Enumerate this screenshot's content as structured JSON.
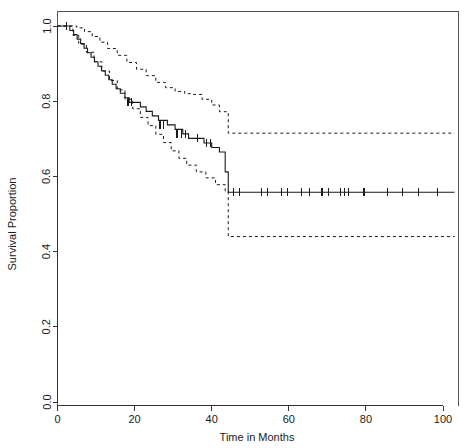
{
  "chart_data": {
    "type": "line",
    "title": "",
    "xlabel": "Time in Months",
    "ylabel": "Survival Proportion",
    "xlim": [
      0,
      103
    ],
    "ylim": [
      0.0,
      1.0
    ],
    "grid": false,
    "legend": null,
    "xticks": [
      0,
      20,
      40,
      60,
      80,
      100
    ],
    "xticklabels": [
      "0",
      "20",
      "40",
      "60",
      "80",
      "100"
    ],
    "yticks": [
      0.0,
      0.2,
      0.4,
      0.6,
      0.8,
      1.0
    ],
    "yticklabels": [
      "0.0",
      "0.2",
      "0.4",
      "0.6",
      "0.8",
      "1.0"
    ],
    "series": [
      {
        "name": "Kaplan-Meier estimate",
        "style": "solid-step",
        "x": [
          0,
          2.4,
          3.2,
          4.2,
          5.1,
          6.0,
          6.9,
          7.8,
          8.7,
          9.6,
          10.5,
          11.4,
          12.4,
          13.3,
          14.2,
          15.2,
          16.3,
          17.5,
          18.6,
          20.0,
          21.5,
          23.0,
          24.6,
          26.2,
          28.5,
          30.5,
          32.5,
          34.0,
          36.0,
          38.0,
          40.0,
          42.0,
          43.5,
          44.3,
          103
        ],
        "y": [
          1.0,
          1.0,
          0.988,
          0.977,
          0.965,
          0.953,
          0.941,
          0.929,
          0.917,
          0.905,
          0.893,
          0.881,
          0.869,
          0.857,
          0.845,
          0.833,
          0.821,
          0.809,
          0.797,
          0.797,
          0.785,
          0.773,
          0.761,
          0.749,
          0.737,
          0.725,
          0.713,
          0.701,
          0.701,
          0.689,
          0.677,
          0.665,
          0.612,
          0.558,
          0.558
        ]
      },
      {
        "name": "Upper 95% confidence limit",
        "style": "dashed-step",
        "x": [
          0,
          3.0,
          5.0,
          7.0,
          9.0,
          11.0,
          13.0,
          15.5,
          18.0,
          20.5,
          23.0,
          25.5,
          28.0,
          30.5,
          33.0,
          35.0,
          37.5,
          40.0,
          42.0,
          44.3,
          103
        ],
        "y": [
          1.0,
          1.0,
          0.995,
          0.985,
          0.972,
          0.957,
          0.94,
          0.922,
          0.903,
          0.885,
          0.868,
          0.85,
          0.836,
          0.826,
          0.82,
          0.818,
          0.805,
          0.79,
          0.772,
          0.715,
          0.715
        ]
      },
      {
        "name": "Lower 95% confidence limit",
        "style": "dashed-step",
        "x": [
          0,
          2.5,
          4.0,
          5.5,
          7.5,
          9.5,
          11.5,
          13.5,
          15.5,
          17.5,
          19.5,
          21.5,
          23.5,
          25.5,
          27.5,
          29.5,
          31.5,
          33.5,
          36.0,
          38.5,
          41.0,
          43.5,
          44.3,
          103
        ],
        "y": [
          1.0,
          1.0,
          0.975,
          0.952,
          0.93,
          0.905,
          0.88,
          0.855,
          0.83,
          0.805,
          0.78,
          0.757,
          0.735,
          0.712,
          0.69,
          0.668,
          0.648,
          0.63,
          0.612,
          0.596,
          0.578,
          0.56,
          0.44,
          0.44
        ]
      }
    ],
    "censored_points": [
      {
        "x": 2.3,
        "y": 1.0
      },
      {
        "x": 18.3,
        "y": 0.797
      },
      {
        "x": 19.3,
        "y": 0.797
      },
      {
        "x": 26.6,
        "y": 0.737
      },
      {
        "x": 27.6,
        "y": 0.737
      },
      {
        "x": 31.0,
        "y": 0.713
      },
      {
        "x": 32.2,
        "y": 0.713
      },
      {
        "x": 33.2,
        "y": 0.713
      },
      {
        "x": 36.3,
        "y": 0.701
      },
      {
        "x": 38.6,
        "y": 0.689
      },
      {
        "x": 39.8,
        "y": 0.689
      },
      {
        "x": 45.6,
        "y": 0.558
      },
      {
        "x": 47.3,
        "y": 0.558
      },
      {
        "x": 53.0,
        "y": 0.558
      },
      {
        "x": 54.4,
        "y": 0.558
      },
      {
        "x": 58.0,
        "y": 0.558
      },
      {
        "x": 59.6,
        "y": 0.558
      },
      {
        "x": 63.4,
        "y": 0.558
      },
      {
        "x": 65.4,
        "y": 0.558
      },
      {
        "x": 68.6,
        "y": 0.558
      },
      {
        "x": 70.2,
        "y": 0.558
      },
      {
        "x": 73.3,
        "y": 0.558
      },
      {
        "x": 74.5,
        "y": 0.558
      },
      {
        "x": 75.6,
        "y": 0.558
      },
      {
        "x": 79.5,
        "y": 0.558
      },
      {
        "x": 85.5,
        "y": 0.558
      },
      {
        "x": 89.5,
        "y": 0.558
      },
      {
        "x": 93.6,
        "y": 0.558
      },
      {
        "x": 98.6,
        "y": 0.558
      }
    ],
    "annotations": {
      "plateau_survival": 0.558,
      "plateau_upper": 0.715,
      "plateau_lower": 0.44,
      "plateau_start_month": 44.3
    }
  }
}
